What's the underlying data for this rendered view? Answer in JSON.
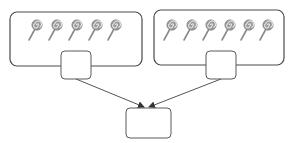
{
  "diagram": {
    "title": "",
    "groups": [
      {
        "id": "left-group",
        "lollipop_count": 5,
        "answer_box_value": ""
      },
      {
        "id": "right-group",
        "lollipop_count": 6,
        "answer_box_value": ""
      }
    ],
    "total_box_value": "",
    "colors": {
      "border": "#4a4a4a",
      "lollipop": "#9a9a9a",
      "background": "#ffffff"
    },
    "icons": [
      "lollipop-icon"
    ]
  }
}
